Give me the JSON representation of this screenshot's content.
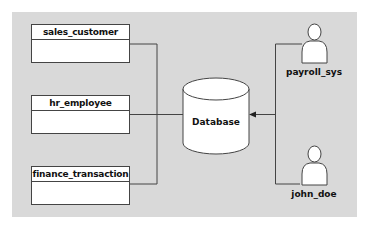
{
  "diagram": {
    "background_color": "#d9d9d9",
    "tables": [
      {
        "name": "sales_customer"
      },
      {
        "name": "hr_employee"
      },
      {
        "name": "finance_transaction"
      }
    ],
    "database": {
      "label": "Database"
    },
    "actors": [
      {
        "name": "payroll_sys"
      },
      {
        "name": "john_doe"
      }
    ],
    "connections": [
      {
        "from": "sales_customer",
        "to": "Database",
        "arrow": false
      },
      {
        "from": "hr_employee",
        "to": "Database",
        "arrow": false
      },
      {
        "from": "finance_transaction",
        "to": "Database",
        "arrow": false
      },
      {
        "from": "payroll_sys",
        "to": "Database",
        "arrow": true
      },
      {
        "from": "john_doe",
        "to": "Database",
        "arrow": true
      }
    ]
  }
}
